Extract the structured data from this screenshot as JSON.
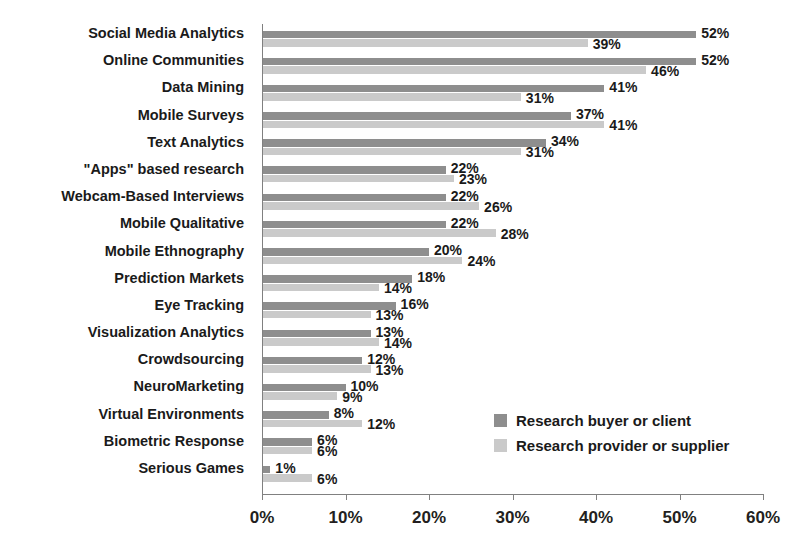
{
  "title": "",
  "legend": {
    "position": "inside-right",
    "items": [
      {
        "label": "Research buyer or client",
        "color": "#8e8e8e"
      },
      {
        "label": "Research provider or supplier",
        "color": "#cacaca"
      }
    ]
  },
  "axis": {
    "ticks": [
      "0%",
      "10%",
      "20%",
      "30%",
      "40%",
      "50%",
      "60%"
    ]
  },
  "chart_data": {
    "type": "bar",
    "orientation": "horizontal",
    "title": "",
    "xlabel": "",
    "ylabel": "",
    "xlim": [
      0,
      60
    ],
    "grid": false,
    "legend_position": "inside-right",
    "tick_labels": [
      "0%",
      "10%",
      "20%",
      "30%",
      "40%",
      "50%",
      "60%"
    ],
    "categories": [
      "Social Media Analytics",
      "Online Communities",
      "Data Mining",
      "Mobile Surveys",
      "Text Analytics",
      "\"Apps\" based research",
      "Webcam-Based Interviews",
      "Mobile Qualitative",
      "Mobile Ethnography",
      "Prediction Markets",
      "Eye Tracking",
      "Visualization Analytics",
      "Crowdsourcing",
      "NeuroMarketing",
      "Virtual Environments",
      "Biometric Response",
      "Serious Games"
    ],
    "series": [
      {
        "name": "Research buyer or client",
        "color": "#8e8e8e",
        "values": [
          52,
          52,
          41,
          37,
          34,
          22,
          22,
          22,
          20,
          18,
          16,
          13,
          12,
          10,
          8,
          6,
          1
        ],
        "labels": [
          "52%",
          "52%",
          "41%",
          "37%",
          "34%",
          "22%",
          "22%",
          "22%",
          "20%",
          "18%",
          "16%",
          "13%",
          "12%",
          "10%",
          "8%",
          "6%",
          "1%"
        ]
      },
      {
        "name": "Research provider or supplier",
        "color": "#cacaca",
        "values": [
          39,
          46,
          31,
          41,
          31,
          23,
          26,
          28,
          24,
          14,
          13,
          14,
          13,
          9,
          12,
          6,
          6
        ],
        "labels": [
          "39%",
          "46%",
          "31%",
          "41%",
          "31%",
          "23%",
          "26%",
          "28%",
          "24%",
          "14%",
          "13%",
          "14%",
          "13%",
          "9%",
          "12%",
          "6%",
          "6%"
        ]
      }
    ]
  }
}
